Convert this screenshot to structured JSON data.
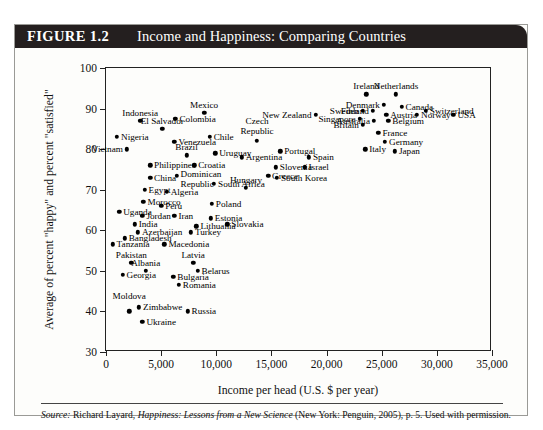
{
  "figure": {
    "number_label": "FIGURE 1.2",
    "title": "Income and Happiness: Comparing Countries"
  },
  "source": {
    "prefix": "Source:",
    "author": "Richard Layard,",
    "work": "Happiness: Lessons from a New Science",
    "rest": "(New York: Penguin, 2005), p. 5. Used with permission."
  },
  "chart_data": {
    "type": "scatter",
    "title": "Income and Happiness: Comparing Countries",
    "xlabel": "Income per head (U.S. $ per year)",
    "ylabel": "Average of percent \"happy\" and percent \"satisfied\"",
    "xlim": [
      0,
      35000
    ],
    "ylim": [
      30,
      100
    ],
    "xticks": [
      0,
      5000,
      10000,
      15000,
      20000,
      25000,
      30000,
      35000
    ],
    "xticklabels": [
      "0",
      "5,000",
      "10,000",
      "15,000",
      "20,000",
      "25,000",
      "30,000",
      "35,000"
    ],
    "yticks": [
      30,
      40,
      50,
      60,
      70,
      80,
      90,
      100
    ],
    "yticklabels": [
      "30",
      "40",
      "50",
      "60",
      "70",
      "80",
      "90",
      "100"
    ],
    "grid": false,
    "legend": false,
    "points": [
      {
        "label": "Indonesia",
        "x": 3100,
        "y": 87.0,
        "pos": "above"
      },
      {
        "label": "Colombia",
        "x": 6300,
        "y": 87.5,
        "pos": "right"
      },
      {
        "label": "Mexico",
        "x": 8900,
        "y": 89.0,
        "pos": "above"
      },
      {
        "label": "El Salvador",
        "x": 5100,
        "y": 85.0,
        "pos": "above"
      },
      {
        "label": "Nigeria",
        "x": 1000,
        "y": 83.0,
        "pos": "right"
      },
      {
        "label": "Chile",
        "x": 9400,
        "y": 83.0,
        "pos": "right"
      },
      {
        "label": "Venezuela",
        "x": 6200,
        "y": 81.8,
        "pos": "right"
      },
      {
        "label": "Vietnam",
        "x": 1900,
        "y": 80.0,
        "pos": "left"
      },
      {
        "label": "Brazil",
        "x": 7300,
        "y": 78.5,
        "pos": "above"
      },
      {
        "label": "Uruguay",
        "x": 9900,
        "y": 79.0,
        "pos": "right"
      },
      {
        "label": "Philippines",
        "x": 4000,
        "y": 76.0,
        "pos": "right"
      },
      {
        "label": "Croatia",
        "x": 8000,
        "y": 76.0,
        "pos": "right"
      },
      {
        "label": "China",
        "x": 4000,
        "y": 73.0,
        "pos": "right"
      },
      {
        "label": "Dominican Republic",
        "x": 6400,
        "y": 73.5,
        "pos": "right2"
      },
      {
        "label": "Egypt",
        "x": 3500,
        "y": 70.0,
        "pos": "right"
      },
      {
        "label": "South Africa",
        "x": 9800,
        "y": 71.5,
        "pos": "right"
      },
      {
        "label": "Algeria",
        "x": 5500,
        "y": 69.5,
        "pos": "right"
      },
      {
        "label": "Morocco",
        "x": 3400,
        "y": 67.0,
        "pos": "right"
      },
      {
        "label": "Peru",
        "x": 5000,
        "y": 66.0,
        "pos": "right"
      },
      {
        "label": "Poland",
        "x": 9600,
        "y": 66.5,
        "pos": "right"
      },
      {
        "label": "Uganda",
        "x": 1200,
        "y": 64.5,
        "pos": "right"
      },
      {
        "label": "Jordan",
        "x": 3300,
        "y": 63.5,
        "pos": "right"
      },
      {
        "label": "Iran",
        "x": 6200,
        "y": 63.5,
        "pos": "right"
      },
      {
        "label": "Estonia",
        "x": 9500,
        "y": 63.0,
        "pos": "right"
      },
      {
        "label": "India",
        "x": 2600,
        "y": 61.5,
        "pos": "right"
      },
      {
        "label": "Lithuania",
        "x": 8200,
        "y": 61.0,
        "pos": "right"
      },
      {
        "label": "Slovakia",
        "x": 11000,
        "y": 61.5,
        "pos": "right"
      },
      {
        "label": "Azerbaijan",
        "x": 2900,
        "y": 59.5,
        "pos": "right"
      },
      {
        "label": "Turkey",
        "x": 7700,
        "y": 59.5,
        "pos": "right"
      },
      {
        "label": "Bangladesh",
        "x": 1700,
        "y": 58.0,
        "pos": "right"
      },
      {
        "label": "Tanzania",
        "x": 600,
        "y": 56.5,
        "pos": "right"
      },
      {
        "label": "Macedonia",
        "x": 5300,
        "y": 56.5,
        "pos": "right"
      },
      {
        "label": "Pakistan",
        "x": 2300,
        "y": 52.0,
        "pos": "above"
      },
      {
        "label": "Latvia",
        "x": 7900,
        "y": 52.0,
        "pos": "above"
      },
      {
        "label": "Albania",
        "x": 3600,
        "y": 50.0,
        "pos": "above"
      },
      {
        "label": "Belarus",
        "x": 8300,
        "y": 50.0,
        "pos": "right"
      },
      {
        "label": "Georgia",
        "x": 1500,
        "y": 49.0,
        "pos": "right"
      },
      {
        "label": "Bulgaria",
        "x": 6100,
        "y": 48.5,
        "pos": "right"
      },
      {
        "label": "Romania",
        "x": 6600,
        "y": 46.5,
        "pos": "right"
      },
      {
        "label": "Moldova",
        "x": 2100,
        "y": 40.0,
        "pos": "above2"
      },
      {
        "label": "Zimbabwe",
        "x": 3000,
        "y": 41.0,
        "pos": "right"
      },
      {
        "label": "Russia",
        "x": 7400,
        "y": 40.0,
        "pos": "right"
      },
      {
        "label": "Ukraine",
        "x": 3300,
        "y": 37.5,
        "pos": "right"
      },
      {
        "label": "New Zealand",
        "x": 19000,
        "y": 88.5,
        "pos": "left"
      },
      {
        "label": "Ireland",
        "x": 23600,
        "y": 93.5,
        "pos": "above"
      },
      {
        "label": "Netherlands",
        "x": 26300,
        "y": 93.5,
        "pos": "above"
      },
      {
        "label": "Denmark",
        "x": 25200,
        "y": 91.0,
        "pos": "left"
      },
      {
        "label": "Canada",
        "x": 26800,
        "y": 90.5,
        "pos": "right"
      },
      {
        "label": "Switzerland",
        "x": 29000,
        "y": 89.5,
        "pos": "right"
      },
      {
        "label": "Sweden",
        "x": 23300,
        "y": 89.5,
        "pos": "left"
      },
      {
        "label": "Finland",
        "x": 24200,
        "y": 89.5,
        "pos": "left"
      },
      {
        "label": "Austria",
        "x": 25400,
        "y": 88.5,
        "pos": "right"
      },
      {
        "label": "Norway",
        "x": 28200,
        "y": 88.5,
        "pos": "right"
      },
      {
        "label": "USA",
        "x": 31500,
        "y": 88.5,
        "pos": "right"
      },
      {
        "label": "Singapore",
        "x": 23000,
        "y": 87.5,
        "pos": "left"
      },
      {
        "label": "Australia",
        "x": 24300,
        "y": 87.0,
        "pos": "left"
      },
      {
        "label": "Belgium",
        "x": 25600,
        "y": 87.0,
        "pos": "right"
      },
      {
        "label": "Britain",
        "x": 23300,
        "y": 86.0,
        "pos": "left"
      },
      {
        "label": "France",
        "x": 24700,
        "y": 84.0,
        "pos": "right"
      },
      {
        "label": "Germany",
        "x": 25300,
        "y": 81.8,
        "pos": "right"
      },
      {
        "label": "Italy",
        "x": 23500,
        "y": 80.0,
        "pos": "right"
      },
      {
        "label": "Japan",
        "x": 26200,
        "y": 79.5,
        "pos": "right"
      },
      {
        "label": "Czech Republic",
        "x": 13700,
        "y": 82.0,
        "pos": "above2"
      },
      {
        "label": "Portugal",
        "x": 15800,
        "y": 79.5,
        "pos": "right"
      },
      {
        "label": "Spain",
        "x": 18400,
        "y": 78.0,
        "pos": "right"
      },
      {
        "label": "Argentina",
        "x": 12300,
        "y": 78.0,
        "pos": "right"
      },
      {
        "label": "Slovenia",
        "x": 15400,
        "y": 75.5,
        "pos": "right"
      },
      {
        "label": "Israel",
        "x": 18000,
        "y": 75.5,
        "pos": "right"
      },
      {
        "label": "Greece",
        "x": 14700,
        "y": 73.5,
        "pos": "right"
      },
      {
        "label": "South Korea",
        "x": 15500,
        "y": 73.0,
        "pos": "right"
      },
      {
        "label": "Hungary",
        "x": 12700,
        "y": 70.5,
        "pos": "above"
      }
    ]
  }
}
